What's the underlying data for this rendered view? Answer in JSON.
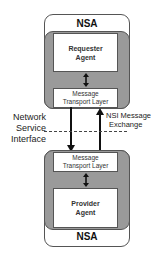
{
  "top_nsa": {
    "label": "NSA",
    "agent": {
      "line1": "Requester",
      "line2": "Agent"
    },
    "transport": {
      "line1": "Message",
      "line2": "Transport Layer"
    }
  },
  "bottom_nsa": {
    "label": "NSA",
    "agent": {
      "line1": "Provider",
      "line2": "Agent"
    },
    "transport": {
      "line1": "Message",
      "line2": "Transport Layer"
    }
  },
  "interface_label": {
    "line1": "Network",
    "line2": "Service",
    "line3": "Interface"
  },
  "exchange_label": {
    "line1": "NSI Message",
    "line2": "Exchange"
  },
  "colors": {
    "gray_fill": "#9a9a9a",
    "border": "#555555",
    "arrow": "#111111"
  }
}
